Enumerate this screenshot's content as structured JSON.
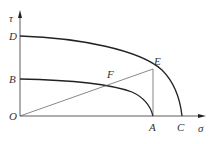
{
  "diagram": {
    "axes": {
      "x_label": "σ",
      "y_label": "τ",
      "origin_label": "O"
    },
    "points": {
      "D": "D",
      "B": "B",
      "E": "E",
      "F": "F",
      "A": "A",
      "C": "C"
    },
    "colors": {
      "line": "#222222",
      "thin_line": "#555555",
      "label": "#333333"
    }
  }
}
